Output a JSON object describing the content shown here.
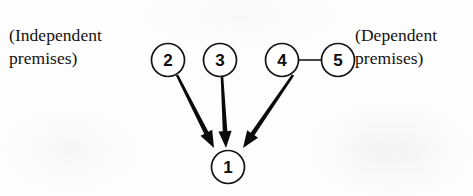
{
  "diagram": {
    "type": "argument-structure-diagram",
    "background_color": "#fdfdfd",
    "ink_color": "#0b0b0b",
    "labels": {
      "left": "(Independent\npremises)",
      "right": "(Dependent\npremises)"
    },
    "nodes": [
      {
        "id": "1",
        "text": "1",
        "cx": 228,
        "cy": 167,
        "r": 16.5,
        "role": "conclusion"
      },
      {
        "id": "2",
        "text": "2",
        "cx": 168,
        "cy": 60,
        "r": 16.5,
        "role": "independent-premise"
      },
      {
        "id": "3",
        "text": "3",
        "cx": 220,
        "cy": 60,
        "r": 16.5,
        "role": "independent-premise"
      },
      {
        "id": "4",
        "text": "4",
        "cx": 282,
        "cy": 60,
        "r": 16.5,
        "role": "dependent-premise"
      },
      {
        "id": "5",
        "text": "5",
        "cx": 338,
        "cy": 60,
        "r": 16.5,
        "role": "dependent-premise"
      }
    ],
    "links": [
      {
        "id": "link-4-5",
        "from": "4",
        "to": "5",
        "style": "plain-line",
        "x1": 298.5,
        "y1": 60,
        "x2": 321.5,
        "y2": 60
      }
    ],
    "arrows": [
      {
        "id": "arrow-2-to-1",
        "from": "2",
        "to": "1",
        "x1": 177,
        "y1": 75,
        "x2": 214,
        "y2": 148
      },
      {
        "id": "arrow-3-to-1",
        "from": "3",
        "to": "1",
        "x1": 222,
        "y1": 77,
        "x2": 226,
        "y2": 148
      },
      {
        "id": "arrow-4-to-1",
        "from": "4",
        "to": "1",
        "x1": 293,
        "y1": 75,
        "x2": 243,
        "y2": 148
      }
    ]
  }
}
